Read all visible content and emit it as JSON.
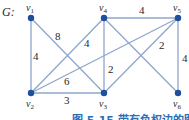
{
  "graph": {
    "name": "G:",
    "nodes": [
      {
        "id": "v1",
        "label": "v1",
        "x": 31,
        "y": 18
      },
      {
        "id": "v2",
        "label": "v2",
        "x": 31,
        "y": 93
      },
      {
        "id": "v3",
        "label": "v3",
        "x": 104,
        "y": 93
      },
      {
        "id": "v4",
        "label": "v4",
        "x": 104,
        "y": 18
      },
      {
        "id": "v5",
        "label": "v5",
        "x": 178,
        "y": 18
      },
      {
        "id": "v6",
        "label": "v6",
        "x": 178,
        "y": 93
      }
    ],
    "edges": [
      {
        "from": "v1",
        "to": "v2",
        "weight": "4"
      },
      {
        "from": "v1",
        "to": "v3",
        "weight": "8"
      },
      {
        "from": "v2",
        "to": "v3",
        "weight": "3"
      },
      {
        "from": "v2",
        "to": "v4",
        "weight": "4"
      },
      {
        "from": "v2",
        "to": "v5",
        "weight": "6"
      },
      {
        "from": "v4",
        "to": "v3",
        "weight": "2"
      },
      {
        "from": "v4",
        "to": "v5",
        "weight": "4"
      },
      {
        "from": "v4",
        "to": "v6",
        "weight": ""
      },
      {
        "from": "v5",
        "to": "v3",
        "weight": "2"
      },
      {
        "from": "v5",
        "to": "v6",
        "weight": "4"
      }
    ]
  },
  "labels": {
    "g": "G:",
    "v1": "v",
    "v1_sub": "1",
    "v2": "v",
    "v2_sub": "2",
    "v3": "v",
    "v3_sub": "3",
    "v4": "v",
    "v4_sub": "4",
    "v5": "v",
    "v5_sub": "5",
    "v6": "v",
    "v6_sub": "6",
    "w_v1v2": "4",
    "w_v1v3": "8",
    "w_v2v3": "3",
    "w_v2v4": "4",
    "w_v2v5": "6",
    "w_v4v3": "2",
    "w_v4v5": "4",
    "w_v5v3": "2",
    "w_v5v6": "4"
  },
  "caption": "图 5.15   带有负权边的图"
}
